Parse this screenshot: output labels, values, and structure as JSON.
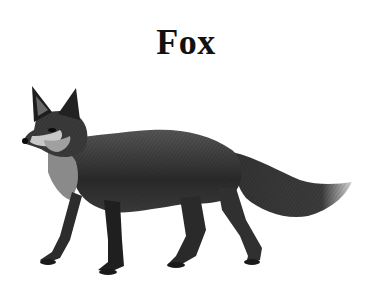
{
  "title": "Fox",
  "illustration": {
    "subject": "fox",
    "style": "black-and-white engraving",
    "colors": {
      "background": "#ffffff",
      "ink_dark": "#1a1a1a",
      "ink_mid": "#4a4a4a",
      "ink_light": "#9a9a9a"
    }
  }
}
